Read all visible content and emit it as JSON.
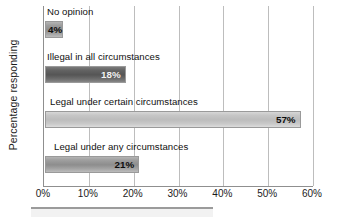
{
  "chart_data": {
    "type": "bar",
    "orientation": "horizontal",
    "title": "",
    "xlabel": "",
    "ylabel": "Percentage responding",
    "xlim": [
      0,
      60
    ],
    "xunit": "%",
    "grid": true,
    "legend": false,
    "categories": [
      "No opinion",
      "Illegal in all circumstances",
      "Legal under certain circumstances",
      "Legal under any circumstances"
    ],
    "values": [
      4,
      18,
      57,
      21
    ],
    "value_labels": [
      "4%",
      "18%",
      "57%",
      "21%"
    ],
    "xticks": [
      0,
      10,
      20,
      30,
      40,
      50,
      60
    ],
    "xtick_labels": [
      "0%",
      "10%",
      "20%",
      "30%",
      "40%",
      "50%",
      "60%"
    ],
    "bar_colors": [
      "#9e9e9e",
      "#5a5a5a",
      "#c4c4c4",
      "#a0a0a0"
    ]
  },
  "axes": {
    "y_title": "Percentage responding"
  }
}
